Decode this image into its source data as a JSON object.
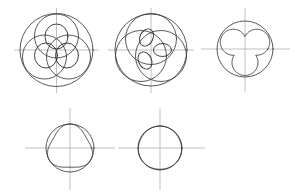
{
  "figure": {
    "background_color": "#ffffff",
    "curve_color": "#3b3b3b",
    "axis_color": "#b9b9b9",
    "width": 299,
    "height": 196,
    "panel_count": 5,
    "rows": [
      3,
      2
    ]
  },
  "panels": [
    {
      "id": "panel-1",
      "label": "panel-1",
      "center": [
        56.5,
        50.0
      ],
      "axis": {
        "h_x1": 14.0,
        "h_x2": 99.0,
        "h_y": 50.0,
        "v_y1": 8.0,
        "v_y2": 93.0,
        "v_x": 56.5
      },
      "outer_circle": {
        "cx": 56.5,
        "cy": 50.0,
        "r": 36.5
      },
      "rolling_circles": [
        {
          "cx": 56.5,
          "cy": 36.0,
          "r": 22.0
        },
        {
          "cx": 44.5,
          "cy": 57.0,
          "r": 22.0
        },
        {
          "cx": 68.5,
          "cy": 57.0,
          "r": 22.0
        }
      ],
      "petals": [
        {
          "cx": 56.5,
          "cy": 36.5,
          "rx": 11.5,
          "ry": 12.5,
          "rot": 0
        },
        {
          "cx": 46.0,
          "cy": 55.5,
          "rx": 11.5,
          "ry": 12.5,
          "rot": 0
        },
        {
          "cx": 67.0,
          "cy": 55.5,
          "rx": 11.5,
          "ry": 12.5,
          "rot": 0
        }
      ],
      "rose": {
        "k": 3,
        "amplitude": 21.0,
        "phase": 90,
        "cusp": 0.0
      }
    },
    {
      "id": "panel-2",
      "label": "panel-2",
      "center": [
        151.0,
        50.0
      ],
      "axis": {
        "h_x1": 108.0,
        "h_x2": 194.0,
        "h_y": 50.0,
        "v_y1": 8.0,
        "v_y2": 93.0,
        "v_x": 151.0
      },
      "outer_circle": {
        "cx": 151.0,
        "cy": 50.0,
        "r": 36.0
      },
      "rolling_circles": [
        {
          "cx": 151.0,
          "cy": 39.0,
          "r": 25.5
        },
        {
          "cx": 141.0,
          "cy": 56.0,
          "r": 25.5
        },
        {
          "cx": 161.0,
          "cy": 56.0,
          "r": 25.5
        }
      ],
      "petals": [
        {
          "cx": 146.5,
          "cy": 37.5,
          "rx": 6.5,
          "ry": 9.0,
          "rot": 25
        },
        {
          "cx": 145.0,
          "cy": 60.5,
          "rx": 6.5,
          "ry": 9.0,
          "rot": -25
        },
        {
          "cx": 162.5,
          "cy": 50.0,
          "rx": 9.0,
          "ry": 6.5,
          "rot": 0
        }
      ],
      "rose": {
        "k": 3,
        "amplitude": 14.0,
        "phase": 90,
        "cusp": 0.35
      }
    },
    {
      "id": "panel-3",
      "label": "panel-3",
      "center": [
        245.0,
        49.0
      ],
      "axis": {
        "h_x1": 201.0,
        "h_x2": 290.0,
        "h_y": 49.0,
        "v_y1": 8.0,
        "v_y2": 92.0,
        "v_x": 245.0
      },
      "outer_circle": {
        "cx": 245.0,
        "cy": 49.0,
        "r": 28.0
      },
      "rolling_circles": [],
      "petals": [],
      "rose": {
        "k": 3,
        "amplitude": 26.0,
        "phase": 90,
        "cusp": 0.62
      },
      "trefoil": {
        "lobes": 3,
        "lobe_r": 13.0,
        "lobe_dist": 13.5,
        "phase": 90
      }
    },
    {
      "id": "panel-4",
      "label": "panel-4",
      "center": [
        70.0,
        148.0
      ],
      "axis": {
        "h_x1": 25.0,
        "h_x2": 115.0,
        "h_y": 148.0,
        "v_y1": 108.0,
        "v_y2": 190.0,
        "v_x": 70.0
      },
      "outer_circle": {
        "cx": 70.0,
        "cy": 148.0,
        "r": 24.0
      },
      "rolling_circles": [],
      "petals": [],
      "rose": {
        "k": 3,
        "amplitude": 24.0,
        "phase": -90,
        "cusp": 0.88
      },
      "rounded_triangle": {
        "r": 24.0,
        "bulge": 0.2,
        "phase": -90
      }
    },
    {
      "id": "panel-5",
      "label": "panel-5",
      "center": [
        160.0,
        148.0
      ],
      "axis": {
        "h_x1": 118.0,
        "h_x2": 205.0,
        "h_y": 148.0,
        "v_y1": 108.0,
        "v_y2": 190.0,
        "v_x": 160.0
      },
      "outer_circle": {
        "cx": 160.0,
        "cy": 148.0,
        "r": 22.0
      },
      "rolling_circles": [],
      "petals": [],
      "rose": {
        "k": 3,
        "amplitude": 22.0,
        "phase": -90,
        "cusp": 0.975
      },
      "rounded_triangle": {
        "r": 22.0,
        "bulge": 0.035,
        "phase": -90
      }
    }
  ]
}
